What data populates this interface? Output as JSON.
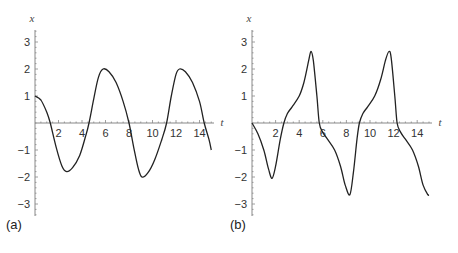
{
  "chart_data": [
    {
      "type": "line",
      "panel_label": "(a)",
      "xlabel": "t",
      "ylabel": "x",
      "xlim": [
        0,
        15.2
      ],
      "ylim": [
        -3.4,
        3.4
      ],
      "x_ticks": [
        2,
        4,
        6,
        8,
        10,
        12,
        14
      ],
      "y_ticks": [
        -3,
        -2,
        -1,
        1,
        2,
        3
      ],
      "grid": false,
      "series": [
        {
          "name": "x(t)",
          "x": [
            0,
            0.5,
            1.0,
            1.3,
            1.8,
            2.3,
            2.7,
            3.2,
            3.8,
            4.3,
            4.6,
            5.0,
            5.4,
            5.8,
            6.3,
            6.9,
            7.5,
            8.0,
            8.4,
            8.8,
            9.1,
            9.6,
            10.2,
            10.8,
            11.2,
            11.6,
            12.0,
            12.3,
            12.8,
            13.4,
            14.0,
            14.4,
            14.8,
            15.0
          ],
          "y": [
            1.0,
            0.85,
            0.4,
            0.0,
            -0.9,
            -1.6,
            -1.8,
            -1.65,
            -1.2,
            -0.5,
            0.0,
            0.9,
            1.7,
            2.0,
            1.9,
            1.5,
            0.8,
            0.0,
            -0.9,
            -1.7,
            -2.0,
            -1.85,
            -1.35,
            -0.6,
            0.0,
            1.0,
            1.8,
            2.0,
            1.9,
            1.5,
            0.8,
            0.0,
            -0.6,
            -1.0
          ]
        }
      ]
    },
    {
      "type": "line",
      "panel_label": "(b)",
      "xlabel": "t",
      "ylabel": "x",
      "xlim": [
        0,
        15.2
      ],
      "ylim": [
        -3.4,
        3.4
      ],
      "x_ticks": [
        2,
        4,
        6,
        8,
        10,
        12,
        14
      ],
      "y_ticks": [
        -3,
        -2,
        -1,
        1,
        2,
        3
      ],
      "grid": false,
      "series": [
        {
          "name": "x(t)",
          "x": [
            0,
            0.5,
            1.0,
            1.4,
            1.7,
            2.0,
            2.4,
            2.7,
            3.0,
            3.4,
            4.0,
            4.4,
            4.8,
            5.0,
            5.2,
            5.5,
            5.7,
            6.0,
            6.4,
            7.0,
            7.5,
            7.9,
            8.3,
            8.6,
            8.9,
            9.1,
            9.4,
            9.8,
            10.4,
            10.9,
            11.3,
            11.6,
            11.8,
            12.1,
            12.3,
            12.6,
            13.0,
            13.6,
            14.1,
            14.5,
            14.9,
            15.0
          ],
          "y": [
            0.0,
            -0.4,
            -1.0,
            -1.7,
            -2.05,
            -1.6,
            -0.6,
            0.0,
            0.35,
            0.6,
            1.0,
            1.5,
            2.3,
            2.65,
            2.3,
            1.0,
            0.0,
            -0.35,
            -0.6,
            -1.0,
            -1.6,
            -2.3,
            -2.65,
            -1.8,
            -0.6,
            0.0,
            0.35,
            0.6,
            1.0,
            1.6,
            2.3,
            2.65,
            2.4,
            1.0,
            0.0,
            -0.35,
            -0.6,
            -1.0,
            -1.6,
            -2.3,
            -2.65,
            -2.65
          ]
        }
      ]
    }
  ]
}
